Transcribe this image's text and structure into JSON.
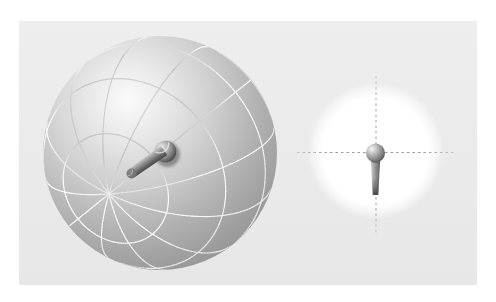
{
  "scene": {
    "width": 496,
    "height": 302,
    "background_color": "#ffffff",
    "panel": {
      "x": 19,
      "y": 21,
      "w": 458,
      "h": 264,
      "color_top": "#eeeeee",
      "color_bottom": "#e7e7e7"
    },
    "sphere": {
      "cx": 160,
      "cy": 153,
      "r": 117,
      "pole_screen": {
        "x": 109,
        "y": 194
      },
      "meridian_count": 12,
      "parallel_latitudes_deg": [
        -60,
        -30,
        0,
        30,
        60
      ],
      "highlight": {
        "x": 128,
        "y": 100
      },
      "light_dir": [
        -0.274,
        -0.453,
        0.848
      ],
      "surface_stops": [
        {
          "o": 0.0,
          "c": "#fbfbfb"
        },
        {
          "o": 0.18,
          "c": "#e9e9e9"
        },
        {
          "o": 0.4,
          "c": "#cfcfcf"
        },
        {
          "o": 0.62,
          "c": "#b2b2b2"
        },
        {
          "o": 0.8,
          "c": "#9d9d9d"
        },
        {
          "o": 1.0,
          "c": "#8a8a8a"
        }
      ],
      "gradient_radius": 210,
      "line_width": 1.15,
      "line_opacity": 0.92
    },
    "knob": {
      "ball": {
        "cx": 165.5,
        "cy": 151.5,
        "r": 10.8,
        "stops": [
          {
            "o": 0.0,
            "c": "#efefef"
          },
          {
            "o": 0.3,
            "c": "#c2c2c2"
          },
          {
            "o": 0.62,
            "c": "#8a8a8a"
          },
          {
            "o": 0.88,
            "c": "#565656"
          },
          {
            "o": 1.0,
            "c": "#454545"
          }
        ]
      },
      "shadow": {
        "cx": 167.5,
        "cy": 154.5,
        "r": 12.5,
        "color": "#474747",
        "opacity": 0.5
      },
      "shaft": {
        "x1": 164,
        "y1": 150.5,
        "x2": 132,
        "y2": 173,
        "w1": 11.2,
        "w2": 10.0,
        "stops": [
          {
            "o": 0.0,
            "c": "#cccccc"
          },
          {
            "o": 0.35,
            "c": "#969696"
          },
          {
            "o": 0.75,
            "c": "#5c5c5c"
          },
          {
            "o": 1.0,
            "c": "#454545"
          }
        ]
      },
      "cap": {
        "cx": 131.5,
        "cy": 173.5,
        "r": 5.0,
        "color_in": "#8e8e8e",
        "color_out": "#606060",
        "rim_color": "#cfcfcf"
      },
      "highlight_arc": {
        "r": 9.2,
        "a1": 175,
        "a2": 290,
        "color": "#f2f2f2",
        "width": 1.4,
        "opacity": 0.75
      }
    },
    "front_view": {
      "glow": {
        "cx": 375.5,
        "cy": 151,
        "r": 68,
        "stops": [
          {
            "o": 0.0,
            "c": "#ffffff",
            "a": 1
          },
          {
            "o": 0.78,
            "c": "#ffffff",
            "a": 1
          },
          {
            "o": 0.9,
            "c": "#ffffff",
            "a": 0.55
          },
          {
            "o": 1.0,
            "c": "#ffffff",
            "a": 0
          }
        ]
      },
      "crosshair": {
        "color_mid": "#9c9c9c",
        "color_end": "#c4c4c4",
        "dash": "2.5 3",
        "width": 1,
        "h": {
          "x1": 297,
          "x2": 455,
          "y": 152.5
        },
        "v": {
          "x": 376,
          "y1": 76,
          "y2": 235
        }
      },
      "pin": {
        "ball": {
          "cx": 375.5,
          "cy": 153,
          "r": 9.5,
          "stops": [
            {
              "o": 0.0,
              "c": "#f5f5f5"
            },
            {
              "o": 0.4,
              "c": "#b5b5b5"
            },
            {
              "o": 0.75,
              "c": "#7a7a7a"
            },
            {
              "o": 1.0,
              "c": "#4a4a4a"
            }
          ]
        },
        "neck_shadow": {
          "cx": 375.5,
          "cy": 161.5,
          "rx": 4.6,
          "ry": 1.6,
          "color": "#5a5a5a",
          "opacity": 0.45
        },
        "shaft": {
          "cx": 375.5,
          "top_y": 160,
          "bottom_y": 195,
          "top_halfw": 4.7,
          "bottom_halfw": 2.7,
          "stops": [
            {
              "o": 0.0,
              "c": "#cfcfcf"
            },
            {
              "o": 0.45,
              "c": "#999999"
            },
            {
              "o": 1.0,
              "c": "#5f5f5f"
            }
          ],
          "tip_color": "#474747",
          "tip_top_y": 192
        }
      }
    }
  }
}
